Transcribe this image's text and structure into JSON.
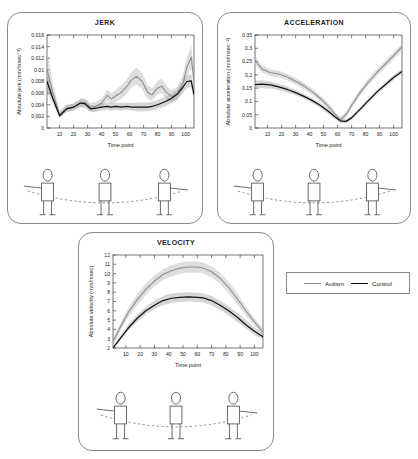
{
  "legend": {
    "position": "right-of-velocity-panel",
    "entries": [
      {
        "label": "Autism",
        "color": "#8c8c8c"
      },
      {
        "label": "Control",
        "color": "#111111"
      }
    ]
  },
  "panels": [
    {
      "id": "jerk",
      "title": "JERK"
    },
    {
      "id": "acceleration",
      "title": "ACCELERATION"
    },
    {
      "id": "velocity",
      "title": "VELOCITY"
    }
  ],
  "illustration": {
    "caption": "reaching-trajectory-stick-figures",
    "figure_count": 3
  },
  "chart_data": [
    {
      "type": "line",
      "id": "jerk",
      "title": "JERK",
      "xlabel": "Time point",
      "ylabel": "Absolute jerk (mm/msec⁻³)",
      "xlim": [
        1,
        106
      ],
      "ylim": [
        0,
        0.016
      ],
      "yticks": [
        0,
        0.002,
        0.004,
        0.006,
        0.008,
        0.01,
        0.012,
        0.014,
        0.016
      ],
      "ytick_labels": [
        "0",
        "0.002",
        "0.004",
        "0.006",
        "0.008",
        "0.01",
        "0.012",
        "0.014",
        "0.016"
      ],
      "xticks": [
        10,
        20,
        30,
        40,
        50,
        60,
        70,
        80,
        90,
        100
      ],
      "xtick_labels": [
        "10",
        "20",
        "30",
        "40",
        "50",
        "60",
        "70",
        "80",
        "90",
        "100"
      ],
      "grid": false,
      "legend_entries": [
        "Autism",
        "Control"
      ],
      "x": [
        1,
        5,
        10,
        15,
        20,
        25,
        28,
        32,
        36,
        40,
        44,
        47,
        50,
        54,
        58,
        61,
        65,
        69,
        73,
        76,
        80,
        83,
        86,
        90,
        94,
        98,
        101,
        104,
        106
      ],
      "series": [
        {
          "name": "Autism",
          "color": "#8c8c8c",
          "values": [
            0.0101,
            0.0062,
            0.0023,
            0.0034,
            0.0036,
            0.0043,
            0.0044,
            0.0036,
            0.0037,
            0.0043,
            0.0056,
            0.005,
            0.0055,
            0.0061,
            0.0071,
            0.0082,
            0.0089,
            0.008,
            0.0061,
            0.0057,
            0.0069,
            0.0072,
            0.0062,
            0.0054,
            0.0059,
            0.0076,
            0.0105,
            0.0122,
            0.0082
          ],
          "band_upper": [
            0.014,
            0.0078,
            0.003,
            0.004,
            0.0042,
            0.005,
            0.0051,
            0.0043,
            0.0045,
            0.0051,
            0.0066,
            0.006,
            0.0066,
            0.0073,
            0.0084,
            0.0096,
            0.0104,
            0.0094,
            0.0073,
            0.0068,
            0.0081,
            0.0085,
            0.0074,
            0.0065,
            0.0071,
            0.009,
            0.0122,
            0.0142,
            0.0101
          ],
          "band_lower": [
            0.007,
            0.0048,
            0.0018,
            0.0028,
            0.003,
            0.0036,
            0.0037,
            0.003,
            0.003,
            0.0036,
            0.0047,
            0.0041,
            0.0045,
            0.005,
            0.0059,
            0.0069,
            0.0075,
            0.0067,
            0.005,
            0.0047,
            0.0058,
            0.006,
            0.0051,
            0.0044,
            0.0048,
            0.0063,
            0.0089,
            0.0103,
            0.0066
          ]
        },
        {
          "name": "Control",
          "color": "#111111",
          "values": [
            0.008,
            0.0052,
            0.0021,
            0.0033,
            0.0036,
            0.0043,
            0.0042,
            0.0033,
            0.0034,
            0.0036,
            0.0037,
            0.0036,
            0.0037,
            0.0036,
            0.0037,
            0.0036,
            0.0036,
            0.0036,
            0.0036,
            0.0037,
            0.004,
            0.0043,
            0.0046,
            0.0051,
            0.0058,
            0.007,
            0.008,
            0.0081,
            0.0058
          ],
          "band_upper": [
            0.0098,
            0.0063,
            0.0026,
            0.0039,
            0.0042,
            0.005,
            0.0049,
            0.0039,
            0.004,
            0.0043,
            0.0044,
            0.0043,
            0.0044,
            0.0043,
            0.0044,
            0.0043,
            0.0044,
            0.0044,
            0.0044,
            0.0045,
            0.0048,
            0.0051,
            0.0054,
            0.0059,
            0.0067,
            0.008,
            0.0091,
            0.0093,
            0.007
          ],
          "band_lower": [
            0.0062,
            0.0042,
            0.0017,
            0.0027,
            0.003,
            0.0036,
            0.0035,
            0.0027,
            0.0028,
            0.003,
            0.0031,
            0.003,
            0.0031,
            0.003,
            0.0031,
            0.003,
            0.0029,
            0.0029,
            0.0029,
            0.003,
            0.0033,
            0.0035,
            0.0038,
            0.0043,
            0.0049,
            0.006,
            0.0069,
            0.007,
            0.0047
          ]
        }
      ]
    },
    {
      "type": "line",
      "id": "acceleration",
      "title": "ACCELERATION",
      "xlabel": "Time point",
      "ylabel": "Absolute acceleration (mm/msec⁻²)",
      "xlim": [
        1,
        106
      ],
      "ylim": [
        0,
        0.35
      ],
      "yticks": [
        0,
        0.05,
        0.1,
        0.15,
        0.2,
        0.25,
        0.3,
        0.35
      ],
      "ytick_labels": [
        "0",
        "0.05",
        "0.1",
        "0.15",
        "0.2",
        "0.25",
        "0.3",
        "0.35"
      ],
      "xticks": [
        10,
        20,
        30,
        40,
        50,
        60,
        70,
        80,
        90,
        100
      ],
      "xtick_labels": [
        "10",
        "20",
        "30",
        "40",
        "50",
        "60",
        "70",
        "80",
        "90",
        "100"
      ],
      "grid": false,
      "legend_entries": [
        "Autism",
        "Control"
      ],
      "x": [
        1,
        6,
        12,
        18,
        24,
        30,
        36,
        42,
        48,
        54,
        58,
        62,
        66,
        70,
        76,
        82,
        88,
        94,
        100,
        106
      ],
      "series": [
        {
          "name": "Autism",
          "color": "#8c8c8c",
          "values": [
            0.255,
            0.222,
            0.208,
            0.203,
            0.192,
            0.176,
            0.158,
            0.136,
            0.11,
            0.078,
            0.053,
            0.031,
            0.05,
            0.085,
            0.133,
            0.173,
            0.208,
            0.24,
            0.272,
            0.305
          ],
          "band_upper": [
            0.272,
            0.235,
            0.22,
            0.215,
            0.204,
            0.188,
            0.17,
            0.148,
            0.121,
            0.089,
            0.063,
            0.041,
            0.06,
            0.096,
            0.145,
            0.186,
            0.221,
            0.253,
            0.285,
            0.318
          ],
          "band_lower": [
            0.238,
            0.209,
            0.196,
            0.191,
            0.18,
            0.164,
            0.146,
            0.124,
            0.099,
            0.067,
            0.043,
            0.022,
            0.04,
            0.074,
            0.121,
            0.16,
            0.195,
            0.227,
            0.259,
            0.292
          ]
        },
        {
          "name": "Control",
          "color": "#111111",
          "values": [
            0.163,
            0.165,
            0.162,
            0.155,
            0.145,
            0.133,
            0.119,
            0.103,
            0.084,
            0.06,
            0.042,
            0.027,
            0.025,
            0.038,
            0.07,
            0.103,
            0.135,
            0.163,
            0.19,
            0.213
          ],
          "band_upper": [
            0.18,
            0.18,
            0.175,
            0.167,
            0.156,
            0.143,
            0.128,
            0.112,
            0.093,
            0.069,
            0.05,
            0.035,
            0.033,
            0.046,
            0.079,
            0.112,
            0.144,
            0.172,
            0.199,
            0.222
          ],
          "band_lower": [
            0.146,
            0.15,
            0.149,
            0.143,
            0.134,
            0.123,
            0.11,
            0.094,
            0.075,
            0.051,
            0.034,
            0.019,
            0.017,
            0.03,
            0.061,
            0.094,
            0.126,
            0.154,
            0.181,
            0.204
          ]
        }
      ]
    },
    {
      "type": "line",
      "id": "velocity",
      "title": "VELOCITY",
      "xlabel": "Time point",
      "ylabel": "Absolute velocity (mm/msec)",
      "xlim": [
        1,
        106
      ],
      "ylim": [
        2,
        12
      ],
      "yticks": [
        2,
        3,
        4,
        5,
        6,
        7,
        8,
        9,
        10,
        11,
        12
      ],
      "ytick_labels": [
        "2",
        "3",
        "4",
        "5",
        "6",
        "7",
        "8",
        "9",
        "10",
        "11",
        "12"
      ],
      "xticks": [
        10,
        20,
        30,
        40,
        50,
        60,
        70,
        80,
        90,
        100
      ],
      "xtick_labels": [
        "10",
        "20",
        "30",
        "40",
        "50",
        "60",
        "70",
        "80",
        "90",
        "100"
      ],
      "grid": false,
      "legend_entries": [
        "Autism",
        "Control"
      ],
      "x": [
        1,
        6,
        12,
        18,
        24,
        30,
        36,
        42,
        48,
        54,
        60,
        64,
        70,
        76,
        82,
        88,
        94,
        100,
        106
      ],
      "series": [
        {
          "name": "Autism",
          "color": "#8c8c8c",
          "values": [
            2.7,
            4.2,
            5.9,
            7.2,
            8.3,
            9.2,
            9.9,
            10.3,
            10.6,
            10.7,
            10.7,
            10.6,
            10.2,
            9.5,
            8.5,
            7.3,
            6.0,
            4.8,
            3.7
          ],
          "band_upper": [
            3.0,
            4.6,
            6.4,
            7.8,
            8.9,
            9.8,
            10.5,
            10.9,
            11.2,
            11.3,
            11.3,
            11.2,
            10.8,
            10.1,
            9.1,
            7.9,
            6.5,
            5.2,
            4.1
          ],
          "band_lower": [
            2.4,
            3.8,
            5.4,
            6.6,
            7.7,
            8.6,
            9.3,
            9.7,
            10.0,
            10.1,
            10.1,
            10.0,
            9.6,
            8.9,
            7.9,
            6.7,
            5.5,
            4.4,
            3.3
          ]
        },
        {
          "name": "Control",
          "color": "#111111",
          "values": [
            2.0,
            3.0,
            4.2,
            5.2,
            6.0,
            6.6,
            7.1,
            7.35,
            7.45,
            7.5,
            7.45,
            7.4,
            7.1,
            6.6,
            6.0,
            5.3,
            4.5,
            3.8,
            3.2
          ],
          "band_upper": [
            2.2,
            3.3,
            4.6,
            5.6,
            6.4,
            7.1,
            7.6,
            7.85,
            7.95,
            8.0,
            7.95,
            7.9,
            7.6,
            7.1,
            6.5,
            5.8,
            5.0,
            4.2,
            3.5
          ],
          "band_lower": [
            1.9,
            2.8,
            3.9,
            4.8,
            5.6,
            6.2,
            6.6,
            6.85,
            6.95,
            7.0,
            6.95,
            6.9,
            6.6,
            6.1,
            5.5,
            4.8,
            4.1,
            3.4,
            2.9
          ]
        }
      ]
    }
  ]
}
